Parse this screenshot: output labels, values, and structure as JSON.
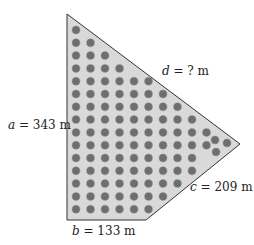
{
  "figure": {
    "type": "land-plot-diagram",
    "polygon_vertices": [
      [
        67,
        14
      ],
      [
        240,
        144
      ],
      [
        146,
        220
      ],
      [
        67,
        220
      ]
    ],
    "fill_color": "#d8d8d8",
    "stroke_color": "#333333",
    "tree_color": "#6a6a6a"
  },
  "labels": {
    "a": {
      "var": "a",
      "text": " = 343 m"
    },
    "b": {
      "var": "b",
      "text": " = 133 m"
    },
    "c": {
      "var": "c",
      "text": " = 209 m"
    },
    "d": {
      "var": "d",
      "text": " = ? m"
    }
  },
  "trees": {
    "row_counts": [
      1,
      2,
      3,
      4,
      6,
      7,
      8,
      9,
      10,
      10,
      9,
      9,
      8,
      7,
      6
    ],
    "extra_near_right_vertex": 3
  }
}
